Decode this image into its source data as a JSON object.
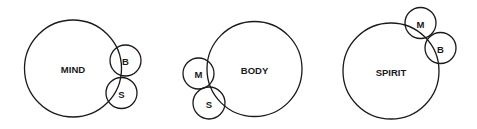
{
  "diagrams": [
    {
      "main": {
        "label": "MIND",
        "cx": 73,
        "cy": 68.5,
        "r": 48.5
      },
      "satellites": [
        {
          "label": "B",
          "cx": 125.5,
          "cy": 60.5,
          "r": 15.5
        },
        {
          "label": "S",
          "cx": 121.5,
          "cy": 93,
          "r": 15.5
        }
      ]
    },
    {
      "main": {
        "label": "BODY",
        "cx": 254.5,
        "cy": 69,
        "r": 47.5
      },
      "satellites": [
        {
          "label": "M",
          "cx": 198.5,
          "cy": 73.5,
          "r": 15.5
        },
        {
          "label": "S",
          "cx": 209,
          "cy": 103,
          "r": 16
        }
      ]
    },
    {
      "main": {
        "label": "SPIRIT",
        "cx": 391,
        "cy": 71,
        "r": 48
      },
      "satellites": [
        {
          "label": "M",
          "cx": 420.5,
          "cy": 23,
          "r": 15.5
        },
        {
          "label": "B",
          "cx": 440.5,
          "cy": 48,
          "r": 15.5
        }
      ]
    }
  ],
  "colors": {
    "stroke": "#1a1a1a",
    "background": "#ffffff"
  }
}
